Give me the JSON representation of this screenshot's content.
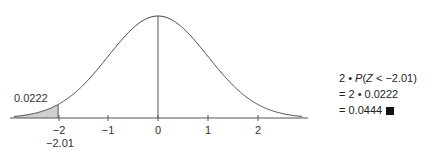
{
  "chart_data": {
    "type": "area",
    "title": "",
    "xlabel": "",
    "ylabel": "",
    "curve": "standard normal density",
    "xlim": [
      -2.9,
      2.9
    ],
    "x_ticks": [
      -2,
      -1,
      0,
      1,
      2
    ],
    "x_tick_labels": [
      "−2",
      "−1",
      "0",
      "1",
      "2"
    ],
    "shaded_region": {
      "from": "-inf",
      "to": -2.01,
      "area": 0.0222
    },
    "vertical_line_at": 0,
    "annotations": [
      {
        "text": "0.0222",
        "position": "above shaded left tail"
      },
      {
        "text": "−2.01",
        "position": "below x-axis at z = -2.01"
      }
    ],
    "grid": false,
    "legend": null
  },
  "labels": {
    "tail_area": "0.0222",
    "z_value": "−2.01",
    "ticks": [
      "−2",
      "−1",
      "0",
      "1",
      "2"
    ]
  },
  "calculation": {
    "line1": "2 • P(Z < −2.01)",
    "line1_prefix": "2 • ",
    "line1_P": "P",
    "line1_rest": "(",
    "line1_Z": "Z",
    "line1_tail": " < −2.01)",
    "line2": "= 2 • 0.0222",
    "line3": "= 0.0444"
  }
}
